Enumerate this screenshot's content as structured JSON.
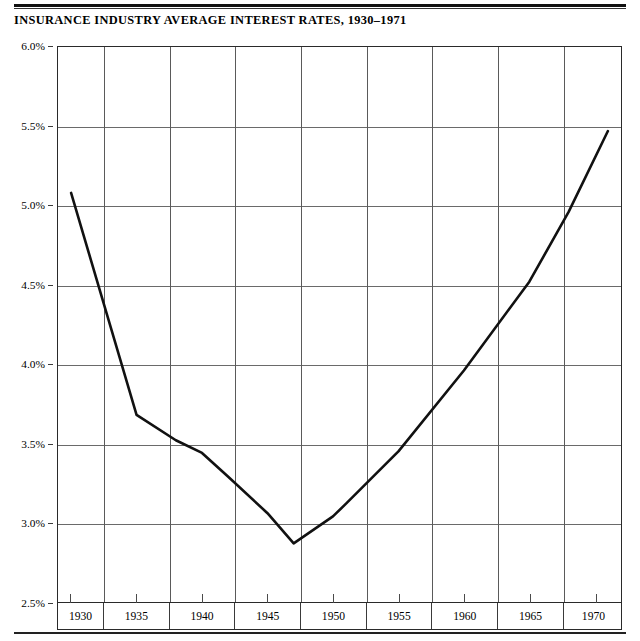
{
  "chart_data": {
    "type": "line",
    "title": "INSURANCE INDUSTRY AVERAGE INTEREST RATES, 1930–1971",
    "xlabel": "",
    "ylabel": "",
    "xlim": [
      1929,
      1972
    ],
    "ylim": [
      2.5,
      6.0
    ],
    "grid": true,
    "legend": "none",
    "y_ticks": [
      "6.0%",
      "5.5%",
      "5.0%",
      "4.5%",
      "4.0%",
      "3.5%",
      "3.0%",
      "2.5%"
    ],
    "y_tick_values": [
      6.0,
      5.5,
      5.0,
      4.5,
      4.0,
      3.5,
      3.0,
      2.5
    ],
    "x_ticks": [
      "1930",
      "1935",
      "1940",
      "1945",
      "1950",
      "1955",
      "1960",
      "1965",
      "1970"
    ],
    "x_tick_values": [
      1930,
      1935,
      1940,
      1945,
      1950,
      1955,
      1960,
      1965,
      1970
    ],
    "series": [
      {
        "name": "Average interest rate",
        "color": "#111111",
        "x": [
          1930,
          1935,
          1938,
          1940,
          1942,
          1945,
          1947,
          1950,
          1951,
          1955,
          1960,
          1965,
          1968,
          1971
        ],
        "values": [
          5.08,
          3.68,
          3.52,
          3.44,
          3.29,
          3.06,
          2.87,
          3.04,
          3.12,
          3.45,
          3.96,
          4.52,
          4.96,
          5.47
        ]
      }
    ]
  },
  "axis": {
    "y": [
      {
        "label": "6.0%",
        "value": 6.0
      },
      {
        "label": "5.5%",
        "value": 5.5
      },
      {
        "label": "5.0%",
        "value": 5.0
      },
      {
        "label": "4.5%",
        "value": 4.5
      },
      {
        "label": "4.0%",
        "value": 4.0
      },
      {
        "label": "3.5%",
        "value": 3.5
      },
      {
        "label": "3.0%",
        "value": 3.0
      },
      {
        "label": "2.5%",
        "value": 2.5
      }
    ],
    "x": [
      {
        "label": "1930",
        "value": 1930
      },
      {
        "label": "1935",
        "value": 1935
      },
      {
        "label": "1940",
        "value": 1940
      },
      {
        "label": "1945",
        "value": 1945
      },
      {
        "label": "1950",
        "value": 1950
      },
      {
        "label": "1955",
        "value": 1955
      },
      {
        "label": "1960",
        "value": 1960
      },
      {
        "label": "1965",
        "value": 1965
      },
      {
        "label": "1970",
        "value": 1970
      }
    ]
  },
  "style": {
    "line_color": "#111111",
    "grid_color": "#5a5a5a",
    "frame_color": "#2a2a2a",
    "background": "#ffffff"
  }
}
